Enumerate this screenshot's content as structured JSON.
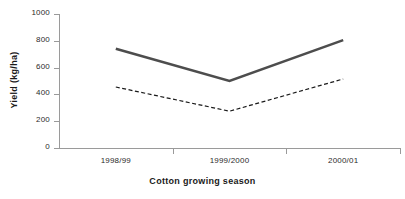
{
  "chart_data": {
    "type": "line",
    "title": "",
    "xlabel": "Cotton growing season",
    "ylabel": "Yield (kg/ha)",
    "categories": [
      "1998/99",
      "1999/2000",
      "2000/01"
    ],
    "ylim": [
      0,
      1000
    ],
    "yticks": [
      0,
      200,
      400,
      600,
      800,
      1000
    ],
    "ytick_labels": [
      "0",
      "200",
      "400",
      "600",
      "800",
      "1000"
    ],
    "grid": false,
    "legend": "none",
    "series": [
      {
        "name": "solid-series",
        "style": "solid",
        "color": "#4d4d4d",
        "width": 2.6,
        "values": [
          740,
          500,
          805
        ]
      },
      {
        "name": "dashed-series",
        "style": "dashed",
        "color": "#1a1a1a",
        "width": 1.2,
        "values": [
          455,
          275,
          515
        ]
      }
    ]
  },
  "axes": {
    "axis_color": "#9a9a9a",
    "tick_label_color": "#2b2b2b",
    "title_color": "#1a1a1a"
  }
}
